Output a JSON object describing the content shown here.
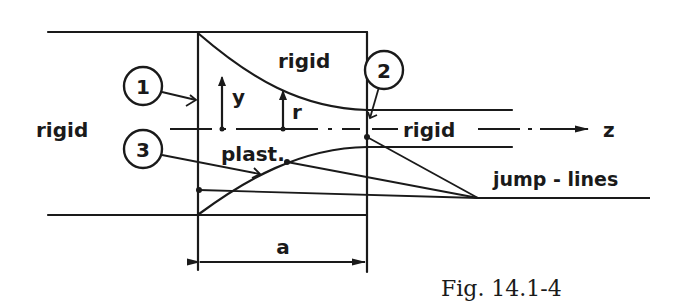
{
  "figure": {
    "caption": "Fig. 14.1-4",
    "labels": {
      "rigid_left": "rigid",
      "rigid_top": "rigid",
      "rigid_right": "rigid",
      "plastic": "plast.",
      "jump_lines": "jump - lines",
      "axis_z": "z",
      "coord_y": "y",
      "coord_r": "r",
      "dimension_a": "a"
    },
    "markers": [
      {
        "id": "1",
        "label": "1"
      },
      {
        "id": "2",
        "label": "2"
      },
      {
        "id": "3",
        "label": "3"
      }
    ],
    "colors": {
      "ink": "#1a1a1a",
      "background": "#ffffff"
    }
  }
}
